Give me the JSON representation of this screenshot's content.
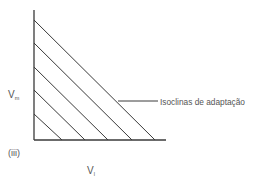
{
  "diagram": {
    "panel_label": "(iii)",
    "y_axis_label": {
      "main": "V",
      "sub": "m"
    },
    "x_axis_label": {
      "main": "V",
      "sub": "l"
    },
    "annotation": "Isoclinas de adaptação",
    "colors": {
      "line": "#3a3a3a",
      "text": "#555555",
      "background": "#ffffff"
    },
    "axes": {
      "origin": [
        34,
        140
      ],
      "y_top": 10,
      "x_right": 166
    },
    "isoclines": [
      {
        "y_intercept": 114,
        "x_intercept": 62
      },
      {
        "y_intercept": 90,
        "x_intercept": 85
      },
      {
        "y_intercept": 67,
        "x_intercept": 108
      },
      {
        "y_intercept": 43,
        "x_intercept": 132
      },
      {
        "y_intercept": 20,
        "x_intercept": 155
      }
    ],
    "leader_line": {
      "x1": 118,
      "y1": 101,
      "x2": 158,
      "y2": 101
    }
  }
}
